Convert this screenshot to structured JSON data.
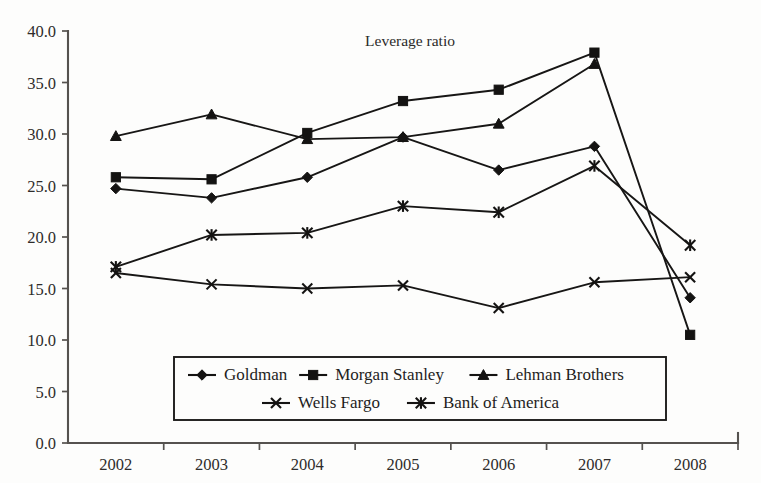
{
  "chart_data": {
    "type": "line",
    "title": "Leverage ratio",
    "xlabel": "",
    "ylabel": "",
    "categories": [
      "2002",
      "2003",
      "2004",
      "2005",
      "2006",
      "2007",
      "2008"
    ],
    "ylim": [
      0.0,
      40.0
    ],
    "ytick_step": 5.0,
    "ytick_labels": [
      "0.0",
      "5.0",
      "10.0",
      "15.0",
      "20.0",
      "25.0",
      "30.0",
      "35.0",
      "40.0"
    ],
    "ytick_values": [
      0.0,
      5.0,
      10.0,
      15.0,
      20.0,
      25.0,
      30.0,
      35.0,
      40.0
    ],
    "grid": false,
    "legend_position": "bottom-inside",
    "series": [
      {
        "name": "Goldman",
        "marker": "diamond",
        "values": [
          24.7,
          23.8,
          25.8,
          29.7,
          26.5,
          28.8,
          14.1
        ]
      },
      {
        "name": "Morgan Stanley",
        "marker": "square",
        "values": [
          25.8,
          25.6,
          30.1,
          33.2,
          34.3,
          37.9,
          10.5
        ]
      },
      {
        "name": "Lehman Brothers",
        "marker": "triangle",
        "values": [
          29.8,
          31.9,
          29.5,
          29.7,
          31.0,
          36.8,
          null
        ]
      },
      {
        "name": "Wells Fargo",
        "marker": "cross-x",
        "values": [
          16.5,
          15.4,
          15.0,
          15.3,
          13.1,
          15.6,
          16.1
        ]
      },
      {
        "name": "Bank of America",
        "marker": "asterisk",
        "values": [
          17.1,
          20.2,
          20.4,
          23.0,
          22.4,
          26.9,
          19.2
        ]
      }
    ]
  },
  "legend": {
    "row1": [
      "Goldman",
      "Morgan Stanley",
      "Lehman Brothers"
    ],
    "row2": [
      "Wells Fargo",
      "Bank of America"
    ]
  },
  "colors": {
    "ink": "#141312",
    "axis": "#55524f",
    "background": "#fdfdfc"
  }
}
